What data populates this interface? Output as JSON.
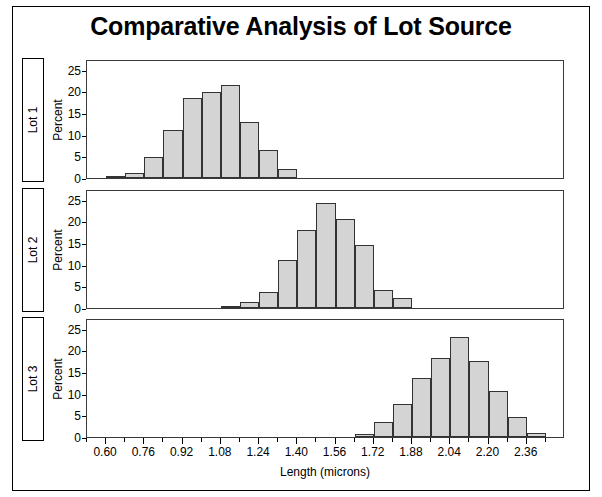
{
  "chart_title": "Comparative Analysis of Lot Source",
  "axis": {
    "xlabel": "Length (microns)",
    "ylabel": "Percent",
    "xtick_labels": [
      "0.60",
      "0.76",
      "0.92",
      "1.08",
      "1.24",
      "1.40",
      "1.56",
      "1.72",
      "1.88",
      "2.04",
      "2.20",
      "2.36"
    ],
    "xtick_values": [
      0.6,
      0.76,
      0.92,
      1.08,
      1.24,
      1.4,
      1.56,
      1.72,
      1.88,
      2.04,
      2.2,
      2.36
    ],
    "ytick_labels": [
      "0",
      "5",
      "10",
      "15",
      "20",
      "25"
    ],
    "ytick_values": [
      0,
      5,
      10,
      15,
      20,
      25
    ]
  },
  "panels": [
    {
      "row_label": "Lot 1"
    },
    {
      "row_label": "Lot 2"
    },
    {
      "row_label": "Lot 3"
    }
  ],
  "colors": {
    "bar_fill": "#d4d4d4",
    "bar_stroke": "#333333",
    "frame": "#000000",
    "background": "#ffffff"
  },
  "chart_data": {
    "type": "bar",
    "title": "Comparative Analysis of Lot Source",
    "xlabel": "Length (microns)",
    "ylabel": "Percent",
    "xlim": [
      0.52,
      2.52
    ],
    "ylim": [
      0,
      27.5
    ],
    "bin_width": 0.08,
    "grid": false,
    "legend": "none",
    "layout": "3 stacked panels sharing one x-axis, row headers on left",
    "panels": [
      {
        "name": "Lot 1",
        "bin_centers": [
          0.64,
          0.72,
          0.8,
          0.88,
          0.96,
          1.04,
          1.12,
          1.2,
          1.28,
          1.36
        ],
        "values": [
          0.4,
          1.2,
          4.8,
          11.2,
          18.6,
          19.8,
          21.4,
          13.0,
          6.4,
          2.0
        ]
      },
      {
        "name": "Lot 2",
        "bin_centers": [
          1.12,
          1.2,
          1.28,
          1.36,
          1.44,
          1.52,
          1.6,
          1.68,
          1.76,
          1.84
        ],
        "values": [
          0.3,
          1.3,
          3.6,
          11.2,
          18.0,
          24.2,
          20.6,
          14.6,
          4.2,
          2.4
        ]
      },
      {
        "name": "Lot 3",
        "bin_centers": [
          1.68,
          1.76,
          1.84,
          1.92,
          2.0,
          2.08,
          2.16,
          2.24,
          2.32,
          2.4
        ],
        "values": [
          0.6,
          3.4,
          7.6,
          13.6,
          18.2,
          23.0,
          17.6,
          10.6,
          4.6,
          1.0
        ]
      }
    ]
  }
}
